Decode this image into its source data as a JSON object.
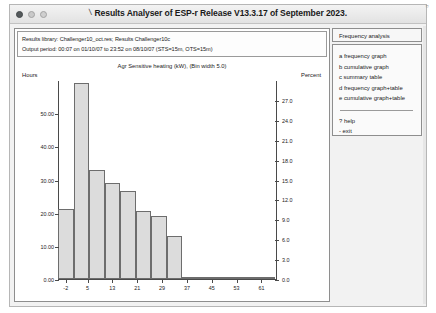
{
  "window": {
    "title": "Results Analyser of ESP-r Release V13.3.17 of September 2023.",
    "title_glyph": "\\",
    "tb_right_glyph": "▫"
  },
  "info": {
    "line1": "Results library: Challenger10_oct.res; Results Challenger10c",
    "line2": "Output period: 00:07 on 01/10/07 to 23:52 on 08/10/07  (STS=15m, OTS=15m)"
  },
  "menu": {
    "header": "Frequency analysis",
    "items": [
      "a frequency graph",
      "b cumulative graph",
      "c summary table",
      "d frequency graph+table",
      "e cumulative graph+table"
    ],
    "footer": [
      "? help",
      "- exit"
    ]
  },
  "chart_data": {
    "type": "bar",
    "title": "Agr Sensitive heating (kW), (Bin width  5.0)",
    "xlabel": "",
    "ylabel": "Hours",
    "y2label": "Percent",
    "bin_width": 5.0,
    "categories": [
      -2,
      3,
      8,
      13,
      18,
      23,
      28,
      33,
      38,
      43,
      48,
      53,
      58,
      63
    ],
    "xtick_labels": [
      "-2",
      "5",
      "13",
      "21",
      "29",
      "37",
      "45",
      "53",
      "61"
    ],
    "xtick_values": [
      -2,
      5,
      13,
      21,
      29,
      37,
      45,
      53,
      61
    ],
    "values": [
      21.0,
      59.0,
      33.0,
      29.0,
      26.5,
      20.5,
      19.0,
      13.0,
      0.6,
      0.6,
      0.6,
      0.2,
      0.6,
      0.2
    ],
    "ylim": [
      0,
      60
    ],
    "ytick_values": [
      0,
      10,
      20,
      30,
      40,
      50
    ],
    "ytick_labels": [
      "0.00",
      "10.00",
      "20.00",
      "30.00",
      "40.00",
      "50.00"
    ],
    "y2lim": [
      0,
      30
    ],
    "y2tick_values": [
      0,
      3,
      6,
      9,
      12,
      15,
      18,
      21,
      24,
      27
    ],
    "y2tick_labels": [
      "0.0",
      "3.0",
      "6.0",
      "9.0",
      "12.0",
      "15.0",
      "18.0",
      "21.0",
      "24.0",
      "27.0"
    ],
    "xlim": [
      -4.5,
      66
    ],
    "grid": false,
    "bar_fill": "#dcdcdc",
    "bar_stroke": "#6d6d6d"
  }
}
